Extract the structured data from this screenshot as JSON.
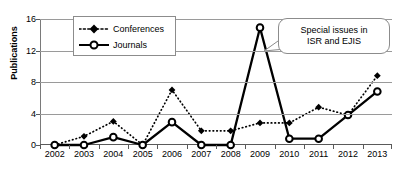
{
  "chart_data": {
    "type": "line",
    "title": "",
    "xlabel": "",
    "ylabel": "Publications",
    "categories": [
      "2002",
      "2003",
      "2004",
      "2005",
      "2006",
      "2007",
      "2008",
      "2009",
      "2010",
      "2011",
      "2012",
      "2013"
    ],
    "ylim": [
      0,
      16
    ],
    "yticks": [
      0,
      4,
      8,
      12,
      16
    ],
    "grid": true,
    "legend_position": "top-left",
    "series": [
      {
        "name": "Conferences",
        "marker": "filled-diamond",
        "line_style": "dotted",
        "color": "#000000",
        "values": [
          0,
          1.1,
          3.0,
          0,
          7.0,
          1.8,
          1.8,
          2.8,
          2.8,
          4.8,
          3.8,
          8.8
        ]
      },
      {
        "name": "Journals",
        "marker": "open-circle",
        "line_style": "solid",
        "color": "#000000",
        "values": [
          0,
          0,
          1.0,
          0,
          2.9,
          0,
          0,
          14.9,
          0.8,
          0.8,
          3.8,
          6.8
        ]
      }
    ],
    "annotations": [
      {
        "text_lines": [
          "Special issues in",
          "ISR and EJIS"
        ],
        "points_to": "2009"
      }
    ]
  },
  "legend": {
    "items": [
      {
        "label": "Conferences"
      },
      {
        "label": "Journals"
      }
    ]
  },
  "callout": {
    "line1": "Special issues in",
    "line2": "ISR and EJIS"
  }
}
